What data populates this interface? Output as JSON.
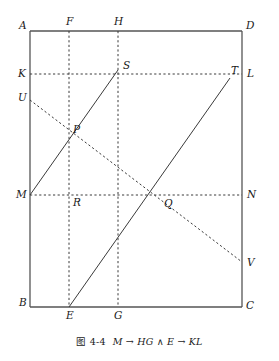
{
  "figure": {
    "caption_number": "图 4-4",
    "caption_formula": "M → HG ∧ E → KL",
    "colors": {
      "stroke": "#3a3a3a",
      "frame": "#555555",
      "label": "#1a1a1a",
      "background": "#ffffff"
    }
  },
  "chart_data": {
    "type": "diagram",
    "xlabel": "",
    "ylabel": "",
    "grid": false,
    "points": [
      {
        "id": "A",
        "label": "A",
        "x": 30,
        "y": 31,
        "label_dx": -11,
        "label_dy": -2
      },
      {
        "id": "D",
        "label": "D",
        "x": 242,
        "y": 31,
        "label_dx": 4,
        "label_dy": -2
      },
      {
        "id": "B",
        "label": "B",
        "x": 30,
        "y": 307,
        "label_dx": -11,
        "label_dy": -1
      },
      {
        "id": "C",
        "label": "C",
        "x": 242,
        "y": 307,
        "label_dx": 4,
        "label_dy": 2
      },
      {
        "id": "F",
        "label": "F",
        "x": 69,
        "y": 31,
        "label_dx": -3,
        "label_dy": -6
      },
      {
        "id": "H",
        "label": "H",
        "x": 118,
        "y": 31,
        "label_dx": -4,
        "label_dy": -6
      },
      {
        "id": "K",
        "label": "K",
        "x": 30,
        "y": 74,
        "label_dx": -12,
        "label_dy": 3
      },
      {
        "id": "L",
        "label": "L",
        "x": 242,
        "y": 74,
        "label_dx": 5,
        "label_dy": 3
      },
      {
        "id": "U",
        "label": "U",
        "x": 30,
        "y": 100,
        "label_dx": -12,
        "label_dy": 1
      },
      {
        "id": "M",
        "label": "M",
        "x": 30,
        "y": 195,
        "label_dx": -14,
        "label_dy": 3
      },
      {
        "id": "N",
        "label": "N",
        "x": 242,
        "y": 195,
        "label_dx": 5,
        "label_dy": 3
      },
      {
        "id": "E",
        "label": "E",
        "x": 69,
        "y": 307,
        "label_dx": -3,
        "label_dy": 12
      },
      {
        "id": "G",
        "label": "G",
        "x": 118,
        "y": 307,
        "label_dx": -4,
        "label_dy": 12
      },
      {
        "id": "V",
        "label": "V",
        "x": 242,
        "y": 262,
        "label_dx": 5,
        "label_dy": 4
      },
      {
        "id": "S",
        "label": "S",
        "x": 118,
        "y": 70,
        "label_dx": 5,
        "label_dy": -1
      },
      {
        "id": "T",
        "label": "T",
        "x": 230,
        "y": 78,
        "label_dx": 1,
        "label_dy": -4
      },
      {
        "id": "P",
        "label": "P",
        "x": 69,
        "y": 128,
        "label_dx": 4,
        "label_dy": 5
      },
      {
        "id": "R",
        "label": "R",
        "x": 69,
        "y": 195,
        "label_dx": 4,
        "label_dy": 11
      },
      {
        "id": "Q",
        "label": "Q",
        "x": 163,
        "y": 195,
        "label_dx": 1,
        "label_dy": 12
      }
    ],
    "segments": [
      {
        "id": "frame-top",
        "name": "A-D",
        "style": "solid",
        "x1": 30,
        "y1": 31,
        "x2": 242,
        "y2": 31
      },
      {
        "id": "frame-right",
        "name": "D-C",
        "style": "solid",
        "x1": 242,
        "y1": 31,
        "x2": 242,
        "y2": 307
      },
      {
        "id": "frame-bottom",
        "name": "B-C",
        "style": "solid",
        "x1": 30,
        "y1": 307,
        "x2": 242,
        "y2": 307
      },
      {
        "id": "frame-left",
        "name": "A-B",
        "style": "solid",
        "x1": 30,
        "y1": 31,
        "x2": 30,
        "y2": 307
      },
      {
        "id": "line-KL",
        "name": "K-L",
        "style": "dashed",
        "x1": 30,
        "y1": 74,
        "x2": 242,
        "y2": 74
      },
      {
        "id": "line-MN",
        "name": "M-N",
        "style": "dashed",
        "x1": 30,
        "y1": 195,
        "x2": 242,
        "y2": 195
      },
      {
        "id": "line-FE",
        "name": "F-E",
        "style": "dashed",
        "x1": 69,
        "y1": 31,
        "x2": 69,
        "y2": 307
      },
      {
        "id": "line-HG",
        "name": "H-G",
        "style": "dashed",
        "x1": 118,
        "y1": 31,
        "x2": 118,
        "y2": 307
      },
      {
        "id": "line-UV",
        "name": "U-V",
        "style": "dashed",
        "x1": 30,
        "y1": 100,
        "x2": 242,
        "y2": 262
      },
      {
        "id": "line-MS",
        "name": "M-S",
        "style": "solid",
        "x1": 30,
        "y1": 195,
        "x2": 118,
        "y2": 70
      },
      {
        "id": "line-ET",
        "name": "E-T",
        "style": "solid",
        "x1": 69,
        "y1": 307,
        "x2": 230,
        "y2": 78
      }
    ]
  }
}
